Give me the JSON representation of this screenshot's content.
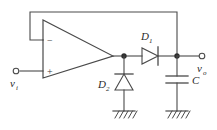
{
  "figure": {
    "name": "op-amp-diode-capacitor-circuit",
    "stroke_color": "#4a4a4a",
    "label_color": "#2a2a2a",
    "background": "#ffffff"
  },
  "labels": {
    "input": {
      "symbol": "v",
      "subscript": "i"
    },
    "output": {
      "symbol": "v",
      "subscript": "o"
    },
    "diode1": {
      "symbol": "D",
      "subscript": "1"
    },
    "diode2": {
      "symbol": "D",
      "subscript": "2"
    },
    "capacitor": {
      "symbol": "C"
    },
    "opamp_inverting": "−",
    "opamp_noninverting": "+"
  },
  "components": [
    {
      "name": "opamp",
      "type": "operational-amplifier"
    },
    {
      "name": "diode-d1",
      "type": "diode",
      "orientation": "horizontal-right"
    },
    {
      "name": "diode-d2",
      "type": "diode",
      "orientation": "vertical-up"
    },
    {
      "name": "capacitor-c",
      "type": "capacitor",
      "orientation": "vertical"
    },
    {
      "name": "ground-d2",
      "type": "ground"
    },
    {
      "name": "ground-c",
      "type": "ground"
    },
    {
      "name": "input-terminal",
      "type": "terminal"
    },
    {
      "name": "output-terminal",
      "type": "terminal"
    },
    {
      "name": "feedback-wire",
      "type": "wire"
    }
  ]
}
